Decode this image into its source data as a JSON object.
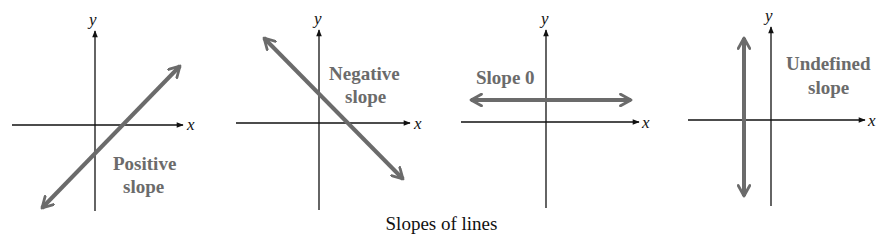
{
  "caption": "Slopes of lines",
  "colors": {
    "axis": "#111111",
    "line": "#6b6b6b",
    "label": "#6b6b6b"
  },
  "panels": [
    {
      "id": "positive",
      "x_label": "x",
      "y_label": "y",
      "label_line1": "Positive",
      "label_line2": "slope"
    },
    {
      "id": "negative",
      "x_label": "x",
      "y_label": "y",
      "label_line1": "Negative",
      "label_line2": "slope"
    },
    {
      "id": "zero",
      "x_label": "x",
      "y_label": "y",
      "label_line1": "Slope 0",
      "label_line2": ""
    },
    {
      "id": "undefined",
      "x_label": "x",
      "y_label": "y",
      "label_line1": "Undefined",
      "label_line2": "slope"
    }
  ]
}
